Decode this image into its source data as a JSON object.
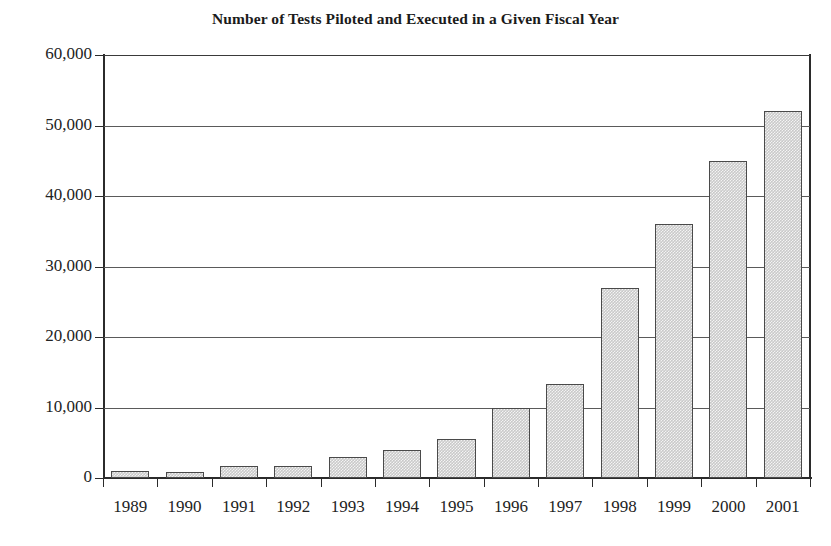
{
  "chart_data": {
    "type": "bar",
    "title": "Number of Tests Piloted and Executed in a Given Fiscal Year",
    "xlabel": "",
    "ylabel": "",
    "categories": [
      "1989",
      "1990",
      "1991",
      "1992",
      "1993",
      "1994",
      "1995",
      "1996",
      "1997",
      "1998",
      "1999",
      "2000",
      "2001"
    ],
    "values": [
      1000,
      900,
      1700,
      1700,
      3000,
      4000,
      5500,
      10000,
      13400,
      27000,
      36000,
      45000,
      52000
    ],
    "ylim": [
      0,
      60000
    ],
    "ytick_values": [
      0,
      10000,
      20000,
      30000,
      40000,
      50000,
      60000
    ],
    "ytick_labels": [
      "0",
      "10,000",
      "20,000",
      "30,000",
      "40,000",
      "50,000",
      "60,000"
    ],
    "grid": true,
    "legend": false,
    "legend_position": "none",
    "bar_fill_color": "#c9c9c9",
    "bar_border_color": "#4a4a4a",
    "axis_color": "#2b2b2b",
    "gridline_color": "#5a5a5a",
    "background_color": "#ffffff",
    "text_color": "#232323"
  }
}
